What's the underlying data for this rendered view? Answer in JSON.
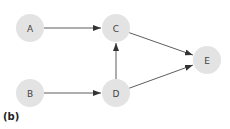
{
  "diagram": {
    "type": "directed-graph",
    "colors": {
      "node_fill": "#e3e3e3",
      "edge": "#333333",
      "label": "#444444"
    },
    "node_radius": 14,
    "nodes": [
      {
        "id": "A",
        "label": "A",
        "x": 30,
        "y": 28
      },
      {
        "id": "B",
        "label": "B",
        "x": 30,
        "y": 93
      },
      {
        "id": "C",
        "label": "C",
        "x": 116,
        "y": 28
      },
      {
        "id": "D",
        "label": "D",
        "x": 116,
        "y": 93
      },
      {
        "id": "E",
        "label": "E",
        "x": 207,
        "y": 60
      }
    ],
    "edges": [
      {
        "from": "A",
        "to": "C"
      },
      {
        "from": "B",
        "to": "D"
      },
      {
        "from": "D",
        "to": "C"
      },
      {
        "from": "C",
        "to": "E"
      },
      {
        "from": "D",
        "to": "E"
      }
    ],
    "caption": "(b)"
  }
}
